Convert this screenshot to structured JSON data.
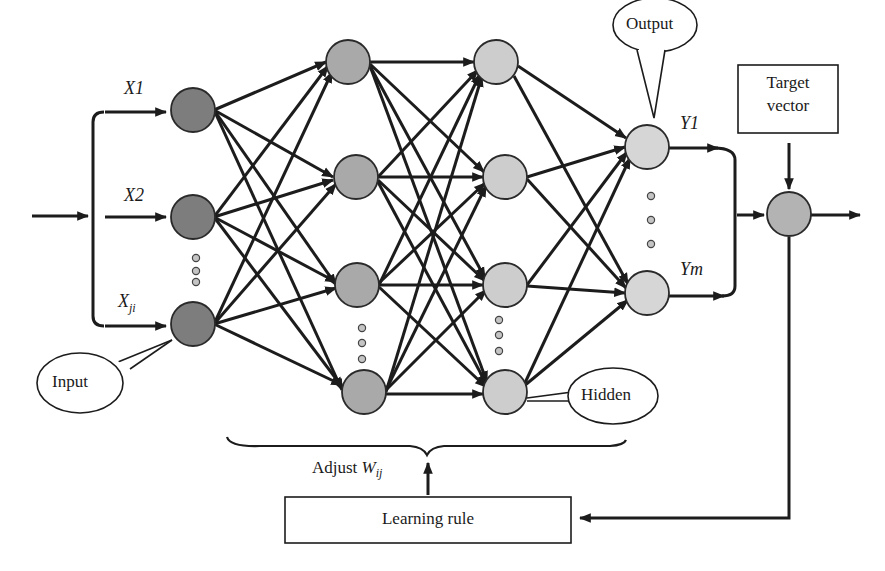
{
  "diagram": {
    "labels": {
      "input_x1": "X1",
      "input_x2": "X2",
      "input_xji_main": "X",
      "input_xji_sub": "ji",
      "output_y1": "Y1",
      "output_ym": "Ym",
      "bubble_input": "Input",
      "bubble_hidden": "Hidden",
      "bubble_output": "Output",
      "target_vector_line1": "Target",
      "target_vector_line2": "vector",
      "adjust_prefix": "Adjust ",
      "adjust_w": "W",
      "adjust_sub": "ij",
      "learning_rule": "Learning rule"
    },
    "colors": {
      "input_node": "#7d7d7d",
      "hidden1_node": "#a9a9a9",
      "hidden2_node": "#cdcdcd",
      "output_node": "#d6d6d6",
      "sum_node": "#b3b3b3",
      "line": "#1c1c1c"
    },
    "layers": [
      {
        "name": "input",
        "nodes": 3,
        "ellipsis": true
      },
      {
        "name": "hidden-1",
        "nodes": 4,
        "ellipsis": true
      },
      {
        "name": "hidden-2",
        "nodes": 4,
        "ellipsis": true
      },
      {
        "name": "output",
        "nodes": 2,
        "ellipsis": true
      }
    ]
  }
}
